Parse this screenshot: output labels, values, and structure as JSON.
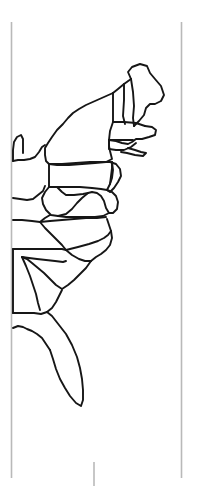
{
  "page": {
    "background_color": "#ffffff",
    "width": 202,
    "height": 486
  },
  "frame": {
    "name": "page-crop-guides",
    "color": "#b9b9b9",
    "left_rule": {
      "x": 11.5,
      "y1": 22,
      "y2": 478
    },
    "right_rule": {
      "x": 181.5,
      "y1": 22,
      "y2": 478
    },
    "bottom_tick": {
      "x": 94,
      "y1": 462,
      "y2": 486
    }
  },
  "map": {
    "name": "eastern-us-map",
    "region": "Eastern United States",
    "stroke_color": "#161616",
    "stroke_width": 1.9,
    "fill_color": "none",
    "projection_note": "state boundary line work, no labels",
    "states_depicted": [
      "Maine",
      "New Hampshire",
      "Vermont",
      "Massachusetts",
      "Rhode Island",
      "Connecticut",
      "New York",
      "New Jersey",
      "Pennsylvania",
      "Delaware",
      "Maryland",
      "West Virginia",
      "Virginia",
      "Ohio",
      "Kentucky",
      "Tennessee",
      "North Carolina",
      "South Carolina",
      "Georgia",
      "Alabama",
      "Florida"
    ],
    "paths": [
      {
        "id": "maine",
        "label": "Maine",
        "d": "M 131 79 L 128 72 L 132 67 L 140 64 L 147 66 L 150 73 L 155 79 L 161 86 L 164 95 L 161 101 L 155 104 L 150 104 L 146 108 L 144 115 L 139 121 L 134 126"
      },
      {
        "id": "nh-vt-north",
        "label": "New Hampshire and Vermont northern border",
        "d": "M 131 79 L 124 84 L 118 89 L 113 93"
      },
      {
        "id": "vt-nh-divide",
        "label": "Vermont New Hampshire divide",
        "d": "M 124 84 L 124 100 L 123 116 L 125 124"
      },
      {
        "id": "nh-me-divide",
        "label": "New Hampshire Maine divide",
        "d": "M 131 79 L 133 92 L 134 106 L 133 118 L 134 126"
      },
      {
        "id": "ny-vt-border",
        "label": "New York Vermont border",
        "d": "M 113 93 L 113 110 L 113 122"
      },
      {
        "id": "ma-north",
        "label": "Massachusetts northern border",
        "d": "M 113 122 L 124 122 L 136 123 L 145 126"
      },
      {
        "id": "ma-coast",
        "label": "Massachusetts coast and Cape Cod",
        "d": "M 145 126 L 152 127 L 156 130 L 155 135 L 149 137 L 142 139 L 136 139 L 132 142 L 128 144 L 122 143 L 116 141 L 109 140"
      },
      {
        "id": "ma-ct-divide",
        "label": "Massachusetts Connecticut Rhode Island divide",
        "d": "M 109 140 L 117 140 L 126 140 L 133 140"
      },
      {
        "id": "ct-ri",
        "label": "Connecticut Rhode Island coast",
        "d": "M 109 140 L 109 149 L 116 150 L 124 150 L 131 147 L 136 143"
      },
      {
        "id": "long-island",
        "label": "Long Island",
        "d": "M 128 148 L 135 150 L 141 152 L 146 153 L 143 156 L 135 155 L 127 153 L 121 152"
      },
      {
        "id": "ny-hudson-east",
        "label": "New York eastern border to Long Island",
        "d": "M 113 122 L 110 131 L 109 140"
      },
      {
        "id": "ny-main",
        "label": "New York state outline",
        "d": "M 113 93 L 104 97 L 95 101 L 86 105 L 79 109 L 73 113 L 68 118 L 63 124 L 57 130 L 52 137 L 48 143 L 45 148 L 45 155 L 46 161 L 49 164 L 57 165 L 69 165 L 82 164 L 95 163 L 106 162 L 112 159 L 110 151 L 109 146 L 109 140"
      },
      {
        "id": "ny-pa-border",
        "label": "New York Pennsylvania border",
        "d": "M 49 164 L 62 164 L 76 163 L 90 162 L 101 162 L 110 162"
      },
      {
        "id": "pa-outline",
        "label": "Pennsylvania outline",
        "d": "M 49 164 L 49 175 L 49 187 L 57 187 L 68 187 L 80 187 L 92 188 L 101 189 L 107 190 L 110 184 L 111 176 L 112 168 L 112 162"
      },
      {
        "id": "nj-de",
        "label": "New Jersey and Delaware coast",
        "d": "M 110 162 L 116 164 L 120 169 L 121 176 L 118 182 L 114 188 L 110 192 L 107 190"
      },
      {
        "id": "pa-nj-divide",
        "label": "Pennsylvania New Jersey divide",
        "d": "M 112 162 L 113 170 L 112 178 L 110 184"
      },
      {
        "id": "md-de-bay",
        "label": "Maryland Delaware Chesapeake Bay",
        "d": "M 107 190 L 112 192 L 116 196 L 118 202 L 117 209 L 113 213 L 109 213 L 106 208 L 104 201 L 101 196 L 97 193 L 92 192 L 88 193"
      },
      {
        "id": "md-wv-border",
        "label": "Maryland West Virginia border",
        "d": "M 57 187 L 62 192 L 66 195 L 74 195 L 83 194 L 88 193"
      },
      {
        "id": "wv-outline",
        "label": "West Virginia outline",
        "d": "M 49 187 L 45 192 L 42 198 L 43 204 L 46 210 L 51 215 L 58 216 L 66 214 L 72 209 L 77 203 L 82 198 L 88 193"
      },
      {
        "id": "va-outline",
        "label": "Virginia outline",
        "d": "M 58 216 L 66 217 L 75 217 L 85 217 L 95 217 L 103 216 L 109 213"
      },
      {
        "id": "va-nc-border",
        "label": "Virginia North Carolina border",
        "d": "M 40 222 L 50 221 L 62 220 L 74 219 L 86 218 L 97 218 L 106 217"
      },
      {
        "id": "ky-oh-river",
        "label": "Ohio River Kentucky northern border",
        "d": "M 13 198 L 20 199 L 27 200 L 33 199 L 38 195 L 43 191 L 45 186"
      },
      {
        "id": "oh-west",
        "label": "Ohio western border",
        "d": "M 13 161 L 18 160 L 24 160 L 30 159 L 35 157 L 39 152 L 42 147 L 45 145"
      },
      {
        "id": "oh-michigan",
        "label": "Ohio Michigan and Lake Erie",
        "d": "M 13 161 L 13 150 L 14 142 L 17 137 L 21 135 L 23 139 L 23 146 L 23 153"
      },
      {
        "id": "ky-tn-border",
        "label": "Kentucky Tennessee border",
        "d": "M 13 220 L 22 220 L 32 221 L 40 222"
      },
      {
        "id": "ky-va-tn-corner",
        "label": "Kentucky Virginia Tennessee corner",
        "d": "M 40 222 L 45 218 L 50 215"
      },
      {
        "id": "tn-nc-border",
        "label": "Tennessee North Carolina border",
        "d": "M 40 222 L 45 228 L 51 234 L 57 240 L 62 245 L 66 250"
      },
      {
        "id": "tn-south",
        "label": "Tennessee southern border",
        "d": "M 13 249 L 25 249 L 38 249 L 51 249 L 62 249 L 66 250"
      },
      {
        "id": "nc-outline",
        "label": "North Carolina outline",
        "d": "M 66 250 L 78 247 L 89 244 L 98 241 L 104 238 L 108 235 L 111 231 L 109 225 L 107 219"
      },
      {
        "id": "nc-coast",
        "label": "North Carolina coast",
        "d": "M 111 231 L 112 238 L 110 245 L 106 250 L 101 254 L 96 257 L 91 261"
      },
      {
        "id": "nc-sc-border",
        "label": "North Carolina South Carolina border",
        "d": "M 66 250 L 72 255 L 79 259 L 85 261 L 91 261"
      },
      {
        "id": "sc-outline",
        "label": "South Carolina outline",
        "d": "M 91 261 L 86 268 L 80 274 L 74 280 L 68 285 L 62 289 L 56 285 L 50 279 L 44 273 L 38 268 L 32 263 L 27 259 L 22 257"
      },
      {
        "id": "ga-sc-border",
        "label": "Georgia South Carolina border",
        "d": "M 22 257 L 29 258 L 37 259 L 46 260 L 55 261 L 63 262 L 66 261"
      },
      {
        "id": "ga-al-border",
        "label": "Georgia Alabama border",
        "d": "M 22 257 L 26 266 L 30 276 L 33 285 L 36 294 L 38 303 L 40 310"
      },
      {
        "id": "ga-fl-border",
        "label": "Georgia Florida border",
        "d": "M 13 313 L 24 313 L 34 313 L 41 314 L 47 312 L 52 308 L 56 302 L 59 296 L 62 290"
      },
      {
        "id": "al-west",
        "label": "Alabama western border",
        "d": "M 13 249 L 13 262 L 13 276 L 13 290 L 13 302 L 13 313"
      },
      {
        "id": "fl-panhandle",
        "label": "Florida panhandle gulf coast",
        "d": "M 13 328 L 18 326 L 23 327 L 27 329 L 32 331 L 37 334 L 42 338 L 46 344 L 50 350"
      },
      {
        "id": "fl-peninsula",
        "label": "Florida peninsula",
        "d": "M 50 350 L 53 359 L 56 369 L 60 379 L 65 388 L 70 396 L 76 403 L 81 406 L 83 400 L 83 390 L 82 379 L 80 368 L 77 357 L 72 345 L 66 334 L 59 325 L 52 316 L 47 312"
      }
    ]
  }
}
